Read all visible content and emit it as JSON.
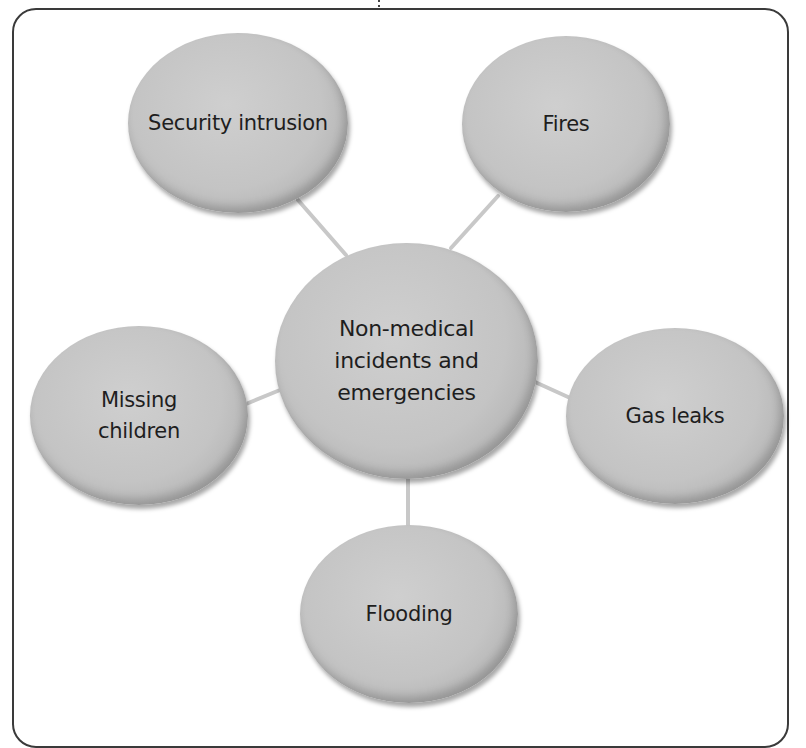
{
  "diagram": {
    "type": "mind-map",
    "center": {
      "id": "center",
      "label": "Non-medical incidents and emergencies",
      "lines": [
        "Non-medical",
        "incidents and",
        "emergencies"
      ]
    },
    "nodes": [
      {
        "id": "security",
        "label": "Security intrusion",
        "lines": [
          "Security intrusion"
        ]
      },
      {
        "id": "fires",
        "label": "Fires",
        "lines": [
          "Fires"
        ]
      },
      {
        "id": "missing",
        "label": "Missing children",
        "lines": [
          "Missing",
          "children"
        ]
      },
      {
        "id": "gas",
        "label": "Gas leaks",
        "lines": [
          "Gas leaks"
        ]
      },
      {
        "id": "flooding",
        "label": "Flooding",
        "lines": [
          "Flooding"
        ]
      }
    ],
    "edges": [
      {
        "from": "center",
        "to": "security"
      },
      {
        "from": "center",
        "to": "fires"
      },
      {
        "from": "center",
        "to": "missing"
      },
      {
        "from": "center",
        "to": "gas"
      },
      {
        "from": "center",
        "to": "flooding"
      }
    ],
    "colors": {
      "node_fill": "#c4c4c4",
      "connector": "#c8c8c8",
      "frame_border": "#3a3a3a",
      "text": "#1e1e1e"
    }
  }
}
